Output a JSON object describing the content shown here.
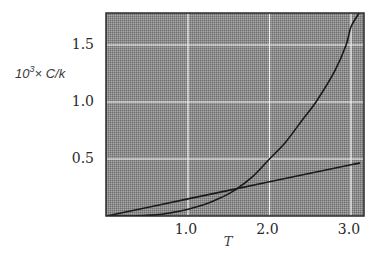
{
  "chart_data": {
    "type": "line",
    "title": "",
    "xlabel": "T",
    "ylabel": "10^3 × C/k",
    "ylabel_parts": {
      "base": "10",
      "sup": "3",
      "rest": "× C/k"
    },
    "xlim": [
      0,
      3.15
    ],
    "ylim": [
      0,
      1.78
    ],
    "grid": true,
    "legend": null,
    "x_ticks": [
      {
        "value": 1.0,
        "label": "1.0"
      },
      {
        "value": 2.0,
        "label": "2.0"
      },
      {
        "value": 3.0,
        "label": "3.0"
      }
    ],
    "y_ticks": [
      {
        "value": 0.5,
        "label": "0.5"
      },
      {
        "value": 1.0,
        "label": "1.0"
      },
      {
        "value": 1.5,
        "label": "1.5"
      }
    ],
    "series": [
      {
        "name": "linear",
        "x": [
          0.0,
          1.0,
          2.0,
          3.0,
          3.08
        ],
        "values": [
          0.0,
          0.15,
          0.3,
          0.45,
          0.46
        ]
      },
      {
        "name": "exponential",
        "x": [
          0.0,
          0.3,
          0.6,
          0.8,
          1.0,
          1.2,
          1.4,
          1.58,
          1.8,
          2.0,
          2.2,
          2.4,
          2.57,
          2.8,
          2.94,
          3.0,
          3.1
        ],
        "values": [
          0.0,
          0.0,
          0.01,
          0.03,
          0.06,
          0.1,
          0.16,
          0.23,
          0.35,
          0.5,
          0.65,
          0.84,
          1.0,
          1.27,
          1.5,
          1.66,
          1.78
        ]
      }
    ]
  },
  "style": {
    "plot_bg": "#8c8c8c",
    "plot_bg_light": "#a8a8a8",
    "plot_bg_dark": "#6e6e6e",
    "grid_color": "#f4f4f4",
    "line_color": "#1a1a1a",
    "frame_color": "#2a2a2a"
  }
}
